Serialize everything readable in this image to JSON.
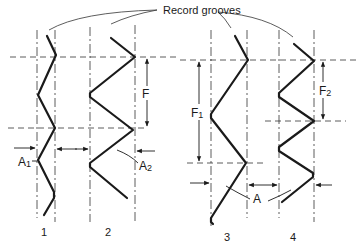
{
  "diagram": {
    "title_label": "Record grooves",
    "grooves": [
      {
        "id": "1",
        "label": "1"
      },
      {
        "id": "2",
        "label": "2"
      },
      {
        "id": "3",
        "label": "3"
      },
      {
        "id": "4",
        "label": "4"
      }
    ],
    "dimensions": {
      "frequency": "F",
      "frequency_1": "F",
      "frequency_1_sub": "1",
      "frequency_2": "F",
      "frequency_2_sub": "2",
      "amplitude_1": "A",
      "amplitude_1_sub": "1",
      "amplitude_2": "A",
      "amplitude_2_sub": "2",
      "amplitude": "A"
    },
    "colors": {
      "ink": "#1a1a1a",
      "background": "#ffffff"
    }
  }
}
